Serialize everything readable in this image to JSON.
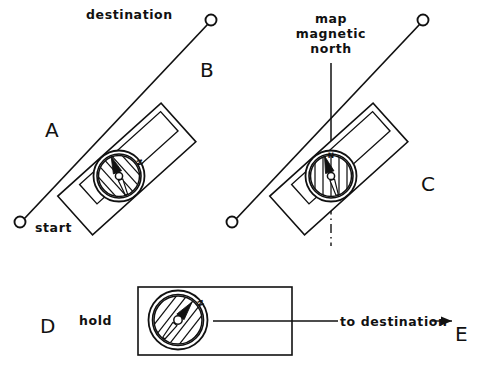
{
  "figure": {
    "background_color": "#ffffff",
    "ink_color": "#111111",
    "width": 482,
    "height": 372
  },
  "panels": {
    "a_label": "A",
    "b_label": "B",
    "c_label": "C",
    "d_label": "D",
    "e_label": "E"
  },
  "annotations": {
    "destination": "destination",
    "start": "start",
    "map_magnetic_north_line1": "map",
    "map_magnetic_north_line2": "magnetic",
    "map_magnetic_north_line3": "north",
    "hold": "hold",
    "to_destination": "to destination"
  },
  "compasses": {
    "left": {
      "name": "compass-on-map-baseplate-aligned-to-route",
      "needle_letter": "N",
      "orienting_lines_angle_deg": 42,
      "needle_heading_deg": -22,
      "dial_style": "diagonal-hatch"
    },
    "right": {
      "name": "compass-dial-rotated-to-magnetic-north",
      "needle_letter": "N",
      "orienting_lines_angle_deg": 90,
      "needle_heading_deg": -18,
      "dial_style": "vertical-hatch"
    },
    "bottom": {
      "name": "compass-held-level-needle-boxed",
      "needle_letter": "N",
      "orienting_lines_angle_deg": 38,
      "needle_heading_deg": 38,
      "dial_style": "diagonal-hatch"
    }
  },
  "markers": {
    "destination_node": "destination-node",
    "start_node": "start-node",
    "destination_node_right": "destination-node-right",
    "start_node_right": "start-node-right"
  }
}
